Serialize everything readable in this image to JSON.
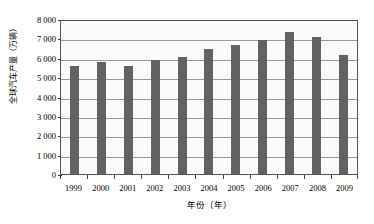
{
  "chart_data": {
    "type": "bar",
    "title": "",
    "xlabel": "年份（年）",
    "ylabel": "全球汽车产量（万辆）",
    "categories": [
      "1999",
      "2000",
      "2001",
      "2002",
      "2003",
      "2004",
      "2005",
      "2006",
      "2007",
      "2008",
      "2009"
    ],
    "values": [
      5600,
      5800,
      5600,
      5900,
      6050,
      6450,
      6650,
      6900,
      7320,
      7050,
      6150
    ],
    "series": [
      {
        "name": "全球汽车产量",
        "values": [
          5600,
          5800,
          5600,
          5900,
          6050,
          6450,
          6650,
          6900,
          7320,
          7050,
          6150
        ]
      }
    ],
    "ylim": [
      0,
      8000
    ],
    "ytick_values": [
      0,
      1000,
      2000,
      3000,
      4000,
      5000,
      6000,
      7000,
      8000
    ],
    "ytick_labels": [
      "0",
      "1 000",
      "2 000",
      "3 000",
      "4 000",
      "5 000",
      "6 000",
      "7 000",
      "8 000"
    ],
    "grid": true,
    "grid_axis": "y",
    "legend": false,
    "legend_position": "none",
    "bar_color": "#636363",
    "plot_background": "#fbfbfb",
    "frame_color": "#555555",
    "gridline_color": "#9a9a9a"
  },
  "axes": {
    "y_title": "全球汽车产量（万辆）",
    "x_title": "年份（年）"
  }
}
